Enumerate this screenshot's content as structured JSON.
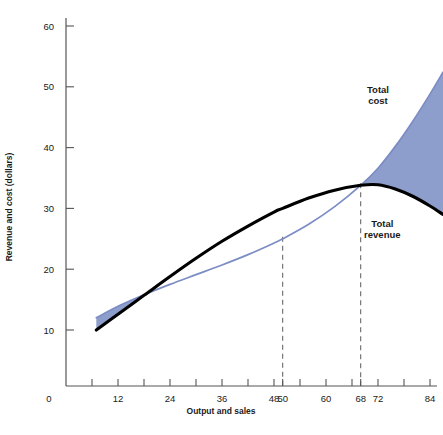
{
  "chart_data": {
    "type": "line",
    "title": "",
    "subtitle": "",
    "xlabel": "Output and sales",
    "ylabel": "Revenue and cost (dollars)",
    "xlim": [
      0,
      87
    ],
    "ylim": [
      0,
      63
    ],
    "grid": false,
    "legend_position": "inline-annotations",
    "x_ticks_labeled": [
      0,
      12,
      24,
      36,
      48,
      50,
      60,
      68,
      72,
      84
    ],
    "x_ticks_minor": [
      6,
      12,
      18,
      24,
      30,
      36,
      42,
      48,
      54,
      60,
      66,
      72,
      78,
      84
    ],
    "y_ticks_labeled": [
      10,
      20,
      30,
      40,
      50,
      60
    ],
    "annotations": [
      {
        "text": "Total cost",
        "x": 72,
        "y": 49
      },
      {
        "text": "Total revenue",
        "x": 73,
        "y": 27
      }
    ],
    "reference_lines": [
      {
        "type": "vertical",
        "x": 50,
        "style": "dashed"
      },
      {
        "type": "vertical",
        "x": 68,
        "style": "dashed"
      }
    ],
    "series": [
      {
        "name": "Total revenue",
        "color": "#000000",
        "points": [
          {
            "x": 7,
            "y": 10.0
          },
          {
            "x": 12,
            "y": 12.6
          },
          {
            "x": 18,
            "y": 15.7
          },
          {
            "x": 24,
            "y": 18.8
          },
          {
            "x": 30,
            "y": 21.8
          },
          {
            "x": 36,
            "y": 24.6
          },
          {
            "x": 42,
            "y": 27.1
          },
          {
            "x": 48,
            "y": 29.4
          },
          {
            "x": 50,
            "y": 30.0
          },
          {
            "x": 56,
            "y": 31.7
          },
          {
            "x": 62,
            "y": 33.0
          },
          {
            "x": 68,
            "y": 33.8
          },
          {
            "x": 72,
            "y": 33.9
          },
          {
            "x": 76,
            "y": 33.2
          },
          {
            "x": 80,
            "y": 32.0
          },
          {
            "x": 84,
            "y": 30.4
          },
          {
            "x": 87,
            "y": 29.0
          }
        ]
      },
      {
        "name": "Total cost",
        "color": "#7c8cc4",
        "points": [
          {
            "x": 7,
            "y": 12.0
          },
          {
            "x": 12,
            "y": 13.9
          },
          {
            "x": 18,
            "y": 15.8
          },
          {
            "x": 24,
            "y": 17.5
          },
          {
            "x": 30,
            "y": 19.1
          },
          {
            "x": 36,
            "y": 20.7
          },
          {
            "x": 42,
            "y": 22.4
          },
          {
            "x": 48,
            "y": 24.3
          },
          {
            "x": 50,
            "y": 25.0
          },
          {
            "x": 56,
            "y": 27.4
          },
          {
            "x": 62,
            "y": 30.3
          },
          {
            "x": 68,
            "y": 33.8
          },
          {
            "x": 72,
            "y": 36.6
          },
          {
            "x": 76,
            "y": 40.2
          },
          {
            "x": 80,
            "y": 44.3
          },
          {
            "x": 84,
            "y": 48.8
          },
          {
            "x": 87,
            "y": 52.4
          }
        ]
      }
    ],
    "shaded_regions": [
      {
        "name": "loss-region-left",
        "color": "#8e9ecc",
        "between": [
          "Total cost",
          "Total revenue"
        ],
        "x_from": 7,
        "x_to": 18
      },
      {
        "name": "loss-region-right",
        "color": "#8e9ecc",
        "between": [
          "Total cost",
          "Total revenue"
        ],
        "x_from": 68,
        "x_to": 87
      }
    ]
  }
}
